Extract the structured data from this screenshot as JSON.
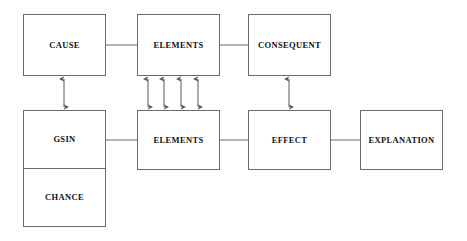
{
  "diagram": {
    "line_color": "#6b6b6b",
    "text_color": "#111111",
    "background": "#ffffff",
    "nodes": [
      {
        "id": "cause",
        "label": "CAUSE",
        "x": 23,
        "y": 14,
        "w": 83,
        "h": 62
      },
      {
        "id": "elements_top",
        "label": "ELEMENTS",
        "x": 137,
        "y": 14,
        "w": 83,
        "h": 62
      },
      {
        "id": "consequent",
        "label": "CONSEQUENT",
        "x": 248,
        "y": 14,
        "w": 83,
        "h": 62
      },
      {
        "id": "elements_bottom",
        "label": "ELEMENTS",
        "x": 137,
        "y": 110,
        "w": 83,
        "h": 60
      },
      {
        "id": "effect",
        "label": "EFFECT",
        "x": 248,
        "y": 110,
        "w": 83,
        "h": 60
      },
      {
        "id": "explanation",
        "label": "EXPLANATION",
        "x": 360,
        "y": 110,
        "w": 83,
        "h": 60
      }
    ],
    "split_node": {
      "id": "gsin_chance",
      "x": 23,
      "y": 110,
      "w": 83,
      "h": 117,
      "cells": [
        {
          "id": "gsin",
          "label": "GSIN"
        },
        {
          "id": "chance",
          "label": "CHANCE"
        }
      ]
    },
    "connectors": [
      {
        "id": "cause-to-elements-top",
        "type": "line",
        "from": "cause",
        "to": "elements_top"
      },
      {
        "id": "elements-top-to-consequent",
        "type": "line",
        "from": "elements_top",
        "to": "consequent"
      },
      {
        "id": "gsin-to-elements-bottom",
        "type": "line",
        "from": "gsin",
        "to": "elements_bottom"
      },
      {
        "id": "elements-bottom-to-effect",
        "type": "line",
        "from": "elements_bottom",
        "to": "effect"
      },
      {
        "id": "effect-to-explanation",
        "type": "line",
        "from": "effect",
        "to": "explanation"
      }
    ],
    "arrows": [
      {
        "id": "cause-gsin-arrow",
        "type": "double-vertical",
        "x": 64,
        "y1": 78,
        "y2": 108
      },
      {
        "id": "elements-link-arrow-1",
        "type": "double-vertical",
        "x": 148,
        "y1": 78,
        "y2": 108
      },
      {
        "id": "elements-link-arrow-2",
        "type": "double-vertical",
        "x": 164,
        "y1": 78,
        "y2": 108
      },
      {
        "id": "elements-link-arrow-3",
        "type": "double-vertical",
        "x": 181,
        "y1": 78,
        "y2": 108
      },
      {
        "id": "elements-link-arrow-4",
        "type": "double-vertical",
        "x": 198,
        "y1": 78,
        "y2": 108
      },
      {
        "id": "consequent-effect-arrow",
        "type": "double-vertical",
        "x": 289,
        "y1": 78,
        "y2": 108
      }
    ]
  }
}
